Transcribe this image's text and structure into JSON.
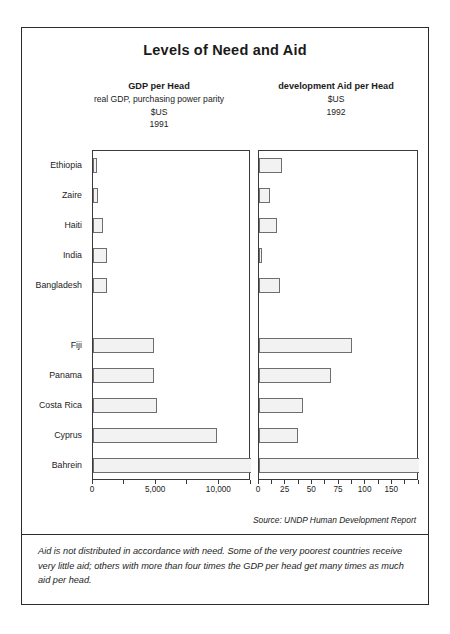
{
  "figure": {
    "title": "Levels of Need and Aid",
    "source_note": "Source: UNDP  Human Development Report",
    "caption": "Aid is not distributed in accordance with need. Some of the very poorest countries receive very little aid; others with more than four times the GDP per head get many times as much aid per head."
  },
  "panels": {
    "left": {
      "title": "GDP per Head",
      "subtitle": "real GDP, purchasing power parity",
      "unit": "$US",
      "year": "1991"
    },
    "right": {
      "title": "development Aid per Head",
      "subtitle": "",
      "unit": "$US",
      "year": "1992"
    }
  },
  "chart_data": {
    "type": "bar",
    "orientation": "horizontal",
    "title": "Levels of Need and Aid",
    "categories": [
      "Ethiopia",
      "Zaire",
      "Haiti",
      "India",
      "Bangladesh",
      "",
      "Fiji",
      "Panama",
      "Costa Rica",
      "Cyprus",
      "Bahrein"
    ],
    "grid": false,
    "legend": "none",
    "series": [
      {
        "name": "GDP per Head",
        "unit": "$US",
        "year": "1991",
        "xlabel": "",
        "xlim": [
          0,
          12500
        ],
        "ticks": [
          0,
          2500,
          5000,
          7500,
          10000,
          12500
        ],
        "tick_labels": [
          "0",
          "",
          "5,000",
          "",
          "10,000",
          ""
        ],
        "values": [
          330,
          380,
          775,
          1150,
          1160,
          null,
          4858,
          4910,
          5100,
          9953,
          12500
        ],
        "overflow_flags": [
          false,
          false,
          false,
          false,
          false,
          null,
          false,
          false,
          false,
          false,
          true
        ]
      },
      {
        "name": "development Aid per Head",
        "unit": "$US",
        "year": "1992",
        "xlabel": "",
        "xlim": [
          0,
          150
        ],
        "ticks": [
          0,
          12.5,
          25,
          37.5,
          50,
          62.5,
          75,
          87.5,
          100,
          112.5,
          125,
          137.5,
          150
        ],
        "tick_labels": [
          "0",
          "",
          "25",
          "",
          "50",
          "",
          "75",
          "",
          "100",
          "",
          "150",
          "",
          ""
        ],
        "values": [
          22,
          10,
          17,
          3,
          20,
          null,
          88,
          68,
          42,
          37,
          150
        ],
        "overflow_flags": [
          false,
          false,
          false,
          false,
          false,
          null,
          false,
          false,
          false,
          false,
          true
        ]
      }
    ]
  }
}
